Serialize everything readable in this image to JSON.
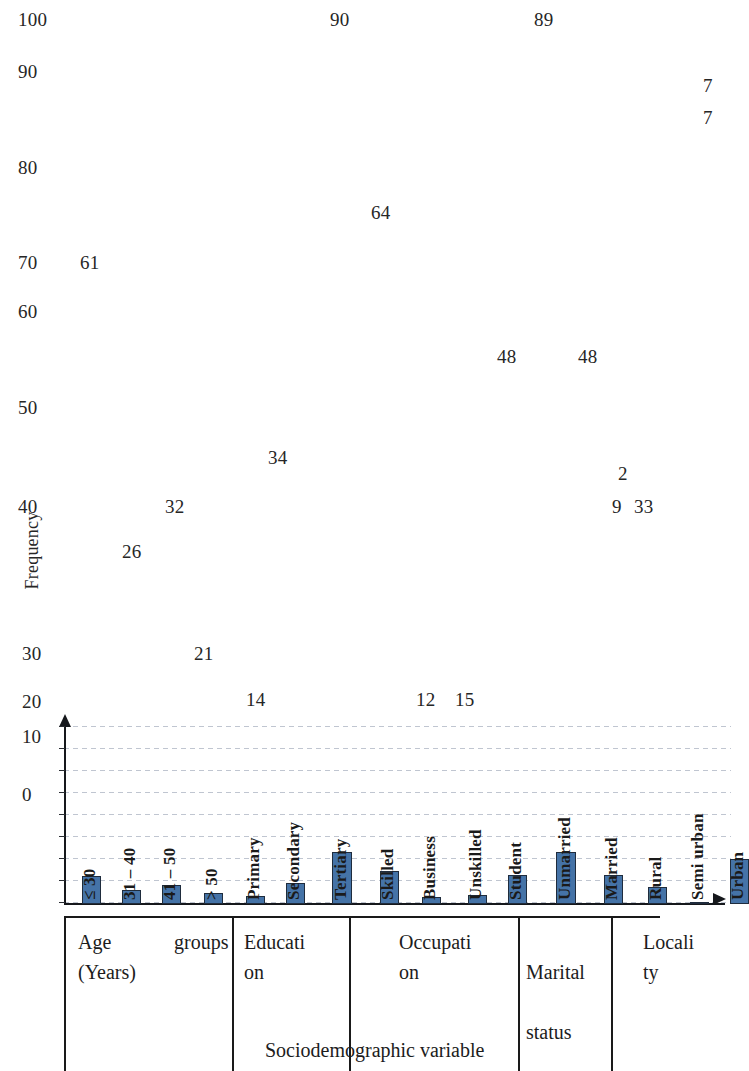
{
  "chart_data": {
    "type": "bar",
    "title": "",
    "xlabel": "Sociodemographic variable",
    "ylabel": "Frequency",
    "grid": true,
    "legend": "none",
    "ylim": [
      0,
      20
    ],
    "y_ticks": [
      "0",
      "10",
      "20",
      "30",
      "40",
      "50",
      "60",
      "70",
      "80",
      "90",
      "100"
    ],
    "visible_axis_ticks": [
      "0",
      "10",
      "20"
    ],
    "categories": [
      "≤ 30",
      "31 – 40",
      "41 – 50",
      "> 50",
      "Primary",
      "Secondary",
      "Tertiary",
      "Skilled",
      "Business",
      "Unskilled",
      "Student",
      "Unmarried",
      "Married",
      "Rural",
      "Semi urban",
      "Urban"
    ],
    "values": [
      61,
      26,
      32,
      21,
      14,
      34,
      90,
      64,
      12,
      15,
      48,
      89,
      48,
      29,
      2,
      77
    ],
    "bar_pixel_heights": [
      28,
      14,
      19,
      11,
      8,
      21,
      52,
      33,
      7,
      9,
      29,
      52,
      29,
      17,
      2,
      45
    ],
    "groups": [
      {
        "label": "Age\n(Years)",
        "secondary_label": "groups",
        "categories": [
          "≤ 30",
          "31 – 40",
          "41 – 50",
          "> 50"
        ]
      },
      {
        "label": "Educati\non",
        "secondary_label": "",
        "categories": [
          "Primary",
          "Secondary",
          "Tertiary"
        ]
      },
      {
        "label": "Occupati\non",
        "secondary_label": "",
        "categories": [
          "Skilled",
          "Business",
          "Unskilled",
          "Student"
        ]
      },
      {
        "label": "Marital\n\nstatus",
        "secondary_label": "",
        "categories": [
          "Unmarried",
          "Married"
        ]
      },
      {
        "label": "Locali\nty",
        "secondary_label": "",
        "categories": [
          "Rural",
          "Semi urban",
          "Urban"
        ]
      }
    ],
    "floating_value_labels": [
      {
        "text": "100",
        "x": 18,
        "y": 10
      },
      {
        "text": "90",
        "x": 330,
        "y": 10
      },
      {
        "text": "89",
        "x": 534,
        "y": 10
      },
      {
        "text": "90",
        "x": 18,
        "y": 62
      },
      {
        "text": "7",
        "x": 703,
        "y": 76
      },
      {
        "text": "7",
        "x": 703,
        "y": 108
      },
      {
        "text": "80",
        "x": 18,
        "y": 158
      },
      {
        "text": "64",
        "x": 371,
        "y": 203
      },
      {
        "text": "70",
        "x": 18,
        "y": 253
      },
      {
        "text": "61",
        "x": 80,
        "y": 253
      },
      {
        "text": "60",
        "x": 18,
        "y": 302
      },
      {
        "text": "48",
        "x": 497,
        "y": 347
      },
      {
        "text": "48",
        "x": 578,
        "y": 347
      },
      {
        "text": "50",
        "x": 18,
        "y": 398
      },
      {
        "text": "34",
        "x": 268,
        "y": 448
      },
      {
        "text": "2",
        "x": 618,
        "y": 464
      },
      {
        "text": "40",
        "x": 18,
        "y": 497
      },
      {
        "text": "32",
        "x": 165,
        "y": 497
      },
      {
        "text": "9",
        "x": 612,
        "y": 497
      },
      {
        "text": "33",
        "x": 634,
        "y": 497
      },
      {
        "text": "26",
        "x": 122,
        "y": 542
      },
      {
        "text": "30",
        "x": 22,
        "y": 644
      },
      {
        "text": "21",
        "x": 194,
        "y": 644
      },
      {
        "text": "20",
        "x": 22,
        "y": 692
      },
      {
        "text": "14",
        "x": 246,
        "y": 690
      },
      {
        "text": "12",
        "x": 416,
        "y": 690
      },
      {
        "text": "15",
        "x": 455,
        "y": 690
      }
    ],
    "axis_ticks_in_plot": [
      {
        "text": "10",
        "x": 22,
        "y": 727
      },
      {
        "text": "0",
        "x": 22,
        "y": 785
      }
    ]
  },
  "bars": [
    {
      "name": "age-le-30",
      "label": "≤ 30",
      "x": 18,
      "w": 19,
      "h": 28,
      "label_bottom_offset": 10
    },
    {
      "name": "age-31-40",
      "label": "31 – 40",
      "x": 58,
      "w": 19,
      "h": 14,
      "label_bottom_offset": 10
    },
    {
      "name": "age-41-50",
      "label": "41 – 50",
      "x": 98,
      "w": 19,
      "h": 19,
      "label_bottom_offset": 10
    },
    {
      "name": "age-gt-50",
      "label": "> 50",
      "x": 140,
      "w": 19,
      "h": 11,
      "label_bottom_offset": 10
    },
    {
      "name": "edu-primary",
      "label": "Primary",
      "x": 182,
      "w": 19,
      "h": 8,
      "label_bottom_offset": 10
    },
    {
      "name": "edu-secondary",
      "label": "Secondary",
      "x": 222,
      "w": 19,
      "h": 21,
      "label_bottom_offset": 10
    },
    {
      "name": "edu-tertiary",
      "label": "Tertiary",
      "x": 268,
      "w": 20,
      "h": 52,
      "label_bottom_offset": 10
    },
    {
      "name": "occ-skilled",
      "label": "Skilled",
      "x": 316,
      "w": 19,
      "h": 33,
      "label_bottom_offset": 10
    },
    {
      "name": "occ-business",
      "label": "Business",
      "x": 358,
      "w": 19,
      "h": 7,
      "label_bottom_offset": 10
    },
    {
      "name": "occ-unskilled",
      "label": "Unskilled",
      "x": 404,
      "w": 19,
      "h": 9,
      "label_bottom_offset": 10
    },
    {
      "name": "occ-student",
      "label": "Student",
      "x": 444,
      "w": 19,
      "h": 29,
      "label_bottom_offset": 10
    },
    {
      "name": "mar-unmarried",
      "label": "Unmarried",
      "x": 492,
      "w": 20,
      "h": 52,
      "label_bottom_offset": 10
    },
    {
      "name": "mar-married",
      "label": "Married",
      "x": 540,
      "w": 19,
      "h": 29,
      "label_bottom_offset": 10
    },
    {
      "name": "loc-rural",
      "label": "Rural",
      "x": 584,
      "w": 19,
      "h": 17,
      "label_bottom_offset": 10
    },
    {
      "name": "loc-semiurban",
      "label": "Semi urban",
      "x": 626,
      "w": 19,
      "h": 2,
      "label_bottom_offset": 10
    },
    {
      "name": "loc-urban",
      "label": "Urban",
      "x": 666,
      "w": 19,
      "h": 45,
      "label_bottom_offset": 10
    }
  ],
  "group_table": {
    "cells": [
      {
        "name": "group-age",
        "x": 0,
        "w": 168,
        "primary": "Age",
        "primary_x": 14,
        "primary_y": 12,
        "secondary": "groups",
        "secondary_x": 110,
        "secondary_y": 12,
        "tertiary": "(Years)",
        "tertiary_x": 14,
        "tertiary_y": 42
      },
      {
        "name": "group-education",
        "x": 168,
        "w": 117,
        "primary": "Educati",
        "primary_x": 12,
        "primary_y": 12,
        "secondary": "",
        "secondary_x": 0,
        "secondary_y": 0,
        "tertiary": "on",
        "tertiary_x": 12,
        "tertiary_y": 42
      },
      {
        "name": "group-occupation",
        "x": 285,
        "w": 169,
        "primary": "Occupati",
        "primary_x": 50,
        "primary_y": 12,
        "secondary": "",
        "secondary_x": 0,
        "secondary_y": 0,
        "tertiary": "on",
        "tertiary_x": 50,
        "tertiary_y": 42
      },
      {
        "name": "group-marital",
        "x": 454,
        "w": 93,
        "primary": "Marital",
        "primary_x": 8,
        "primary_y": 42,
        "secondary": "status",
        "secondary_x": 8,
        "secondary_y": 102,
        "tertiary": "",
        "tertiary_x": 0,
        "tertiary_y": 0
      },
      {
        "name": "group-locality",
        "x": 547,
        "w": 120,
        "primary": "Locali",
        "primary_x": 32,
        "primary_y": 12,
        "secondary": "",
        "secondary_x": 0,
        "secondary_y": 0,
        "tertiary": "ty",
        "tertiary_x": 32,
        "tertiary_y": 42
      }
    ],
    "dividers_x": [
      0,
      168,
      285,
      454,
      547
    ],
    "axis_title": "Sociodemographic variable"
  },
  "axis": {
    "y_title": "Frequency"
  },
  "colors": {
    "bar_fill": "#4573a7",
    "bar_stroke": "#1f2c3d",
    "axis": "#16181c",
    "grid": "#8c96aa",
    "text": "#1c1c1c"
  }
}
